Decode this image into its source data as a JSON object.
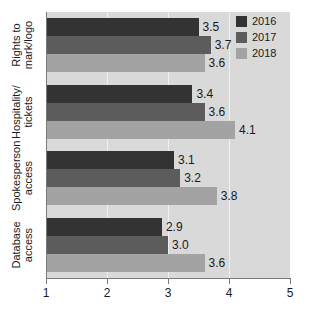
{
  "chart_data": {
    "type": "bar",
    "orientation": "horizontal",
    "title": "",
    "subtitle": "",
    "xlabel": "",
    "ylabel": "",
    "xlim": [
      1,
      5
    ],
    "xticks": [
      "1",
      "2",
      "3",
      "4",
      "5"
    ],
    "grid": true,
    "legend_position": "top-right",
    "categories": [
      "Rights to mark/logo",
      "Hospitality/tickets",
      "Spokesperson access",
      "Database access"
    ],
    "category_lines": [
      [
        "Rights to",
        "mark/logo"
      ],
      [
        "Hospitality/",
        "tickets"
      ],
      [
        "Spokesperson",
        "access"
      ],
      [
        "Database",
        "access"
      ]
    ],
    "series": [
      {
        "name": "2016",
        "color": "#333333",
        "values": [
          3.5,
          3.4,
          3.1,
          2.9
        ]
      },
      {
        "name": "2017",
        "color": "#5c5c5c",
        "values": [
          3.7,
          3.6,
          3.2,
          3.0
        ]
      },
      {
        "name": "2018",
        "color": "#a3a3a3",
        "values": [
          3.6,
          4.1,
          3.8,
          3.6
        ]
      }
    ],
    "value_labels": [
      [
        "3.5",
        "3.7",
        "3.6"
      ],
      [
        "3.4",
        "3.6",
        "4.1"
      ],
      [
        "3.1",
        "3.2",
        "3.8"
      ],
      [
        "2.9",
        "3.0",
        "3.6"
      ]
    ],
    "plot_background": "#d9d9d9",
    "axis_color": "#7a7a7a",
    "gridline_color": "#f0f0f0"
  },
  "legend": {
    "items": [
      {
        "label": "2016"
      },
      {
        "label": "2017"
      },
      {
        "label": "2018"
      }
    ]
  },
  "axis": {
    "x_tick_labels": [
      "1",
      "2",
      "3",
      "4",
      "5"
    ]
  }
}
